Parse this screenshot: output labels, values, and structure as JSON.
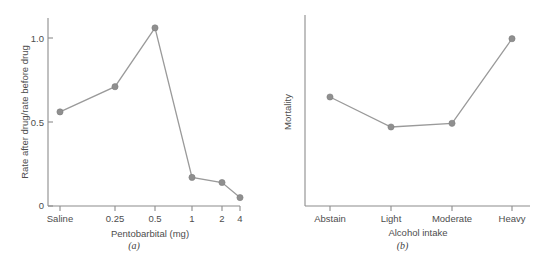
{
  "figure": {
    "background_color": "#ffffff",
    "line_color": "#9a9a9a",
    "marker_color": "#8f8f8f",
    "axis_color": "#8c8c8c",
    "text_color": "#4d4d4d"
  },
  "panel_a": {
    "caption": "(a)",
    "chart": {
      "type": "line",
      "title": "",
      "xlabel": "Pentobarbital (mg)",
      "ylabel": "Rate after drug/rate before drug",
      "categories": [
        "Saline",
        "0.25",
        "0.5",
        "1",
        "2",
        "4"
      ],
      "values": [
        0.56,
        0.71,
        1.06,
        0.17,
        0.14,
        0.05
      ],
      "yticks": [
        "0",
        "0.5",
        "1.0"
      ],
      "ytick_values": [
        0,
        0.5,
        1.0
      ],
      "ylim": [
        0,
        1.15
      ],
      "grid": false,
      "legend": "none"
    }
  },
  "panel_b": {
    "caption": "(b)",
    "chart": {
      "type": "line",
      "title": "",
      "xlabel": "Alcohol intake",
      "ylabel": "Mortality",
      "categories": [
        "Abstain",
        "Light",
        "Moderate",
        "Heavy"
      ],
      "values": [
        0.58,
        0.42,
        0.44,
        0.89
      ],
      "yticks": [],
      "ytick_values": [],
      "ylim": [
        0,
        1
      ],
      "grid": false,
      "legend": "none"
    }
  }
}
